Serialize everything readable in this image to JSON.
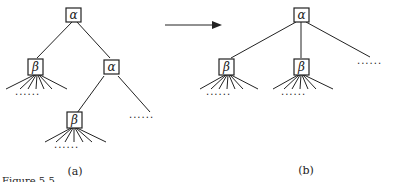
{
  "diagram": {
    "left_tree": {
      "caption": "(a)",
      "root": {
        "label": "α"
      },
      "left_child": {
        "label": "β",
        "leaf_dots": "......"
      },
      "right_child": {
        "label": "α",
        "right_dots": "......"
      },
      "grandchild": {
        "label": "β",
        "leaf_dots": "......"
      }
    },
    "right_tree": {
      "caption": "(b)",
      "root": {
        "label": "α"
      },
      "child1": {
        "label": "β",
        "leaf_dots": "......"
      },
      "child2": {
        "label": "β",
        "leaf_dots": "......"
      },
      "right_dots": "......"
    },
    "arrow": {
      "direction": "right"
    },
    "footer_fragment": "Figure 5.5"
  }
}
